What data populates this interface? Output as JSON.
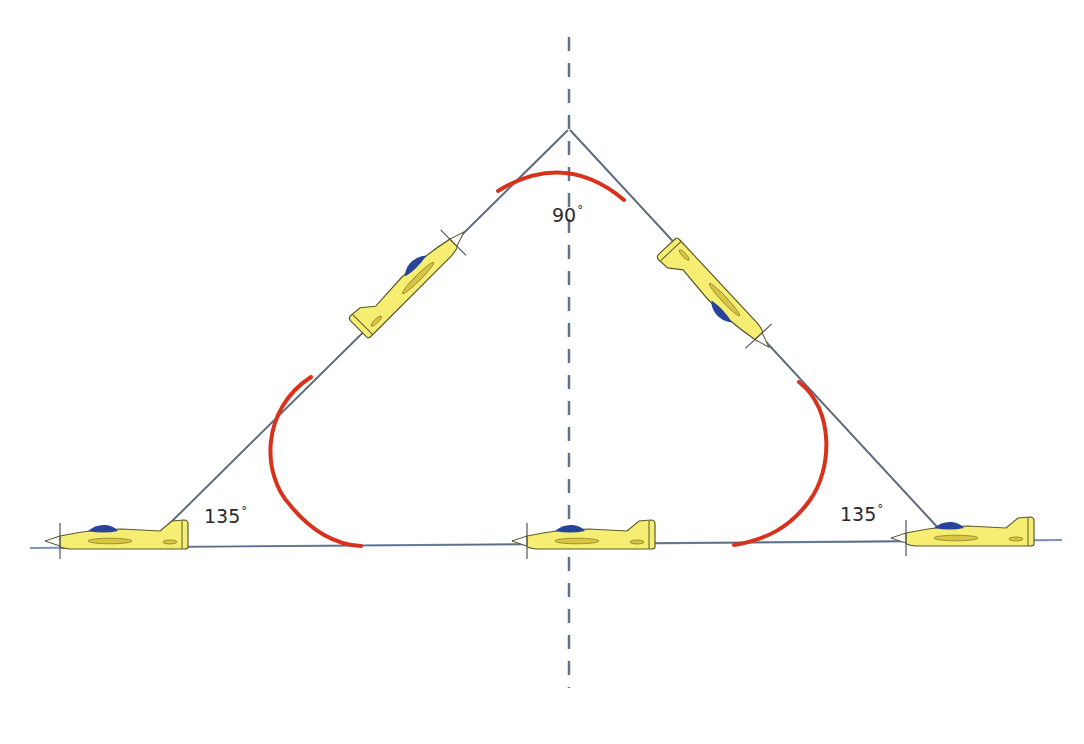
{
  "diagram": {
    "title": "",
    "colors": {
      "path_line": "#5d6b7d",
      "baseline": "#7f95b8",
      "center_line": "#60738b",
      "turn_arc": "#d8321c",
      "plane_body": "#f6ee73",
      "plane_outline": "#5a5a2e",
      "canopy": "#27449a",
      "wing_stripe": "#d8c545"
    },
    "angles": {
      "apex": {
        "value": "90",
        "unit": "°"
      },
      "left_corner": {
        "value": "135",
        "unit": "°"
      },
      "right_corner": {
        "value": "135",
        "unit": "°"
      }
    },
    "aircraft": [
      {
        "id": "plane-left-horizontal",
        "heading": "left"
      },
      {
        "id": "plane-left-climb",
        "heading": "up-right"
      },
      {
        "id": "plane-center-horizontal",
        "heading": "left"
      },
      {
        "id": "plane-right-descent",
        "heading": "down-right"
      },
      {
        "id": "plane-right-horizontal",
        "heading": "left"
      }
    ]
  }
}
